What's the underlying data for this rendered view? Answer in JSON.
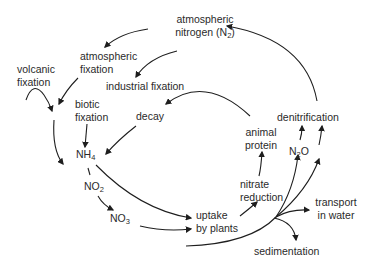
{
  "diagram": {
    "type": "nitrogen-cycle",
    "nodes": {
      "atmospheric_nitrogen": {
        "line1": "atmospheric",
        "line2": "nitrogen (N",
        "sub": "2",
        "tail": ")"
      },
      "atmospheric_fixation": {
        "line1": "atmospheric",
        "line2": "fixation"
      },
      "volcanic_fixation": {
        "line1": "volcanic",
        "line2": "fixation"
      },
      "industrial_fixation": {
        "label": "industrial fixation"
      },
      "biotic_fixation": {
        "line1": "biotic",
        "line2": "fixation"
      },
      "decay": {
        "label": "decay"
      },
      "nh4": {
        "base": "NH",
        "sub": "4"
      },
      "no2": {
        "base": "NO",
        "sub": "2"
      },
      "no3": {
        "base": "NO",
        "sub": "3"
      },
      "uptake_by_plants": {
        "line1": "uptake",
        "line2": "by plants"
      },
      "nitrate_reduction": {
        "line1": "nitrate",
        "line2": "reduction"
      },
      "animal_protein": {
        "line1": "animal",
        "line2": "protein"
      },
      "denitrification": {
        "label": "denitrification"
      },
      "n2o": {
        "base": "N",
        "sub": "2",
        "tail": "O"
      },
      "transport_in_water": {
        "line1": "transport",
        "line2": "in water"
      },
      "sedimentation": {
        "label": "sedimentation"
      }
    },
    "edges": [
      {
        "from": "atmospheric nitrogen (N2)",
        "to": "atmospheric fixation"
      },
      {
        "from": "atmospheric nitrogen (N2)",
        "to": "industrial fixation"
      },
      {
        "from": "atmospheric fixation",
        "to": "NH4 pathway"
      },
      {
        "from": "volcanic fixation",
        "to": "NH4 pathway"
      },
      {
        "from": "biotic fixation",
        "to": "NH4"
      },
      {
        "from": "animal protein",
        "to": "decay"
      },
      {
        "from": "decay",
        "to": "NH4"
      },
      {
        "from": "NH4",
        "to": "NO2"
      },
      {
        "from": "NO2",
        "to": "NO3"
      },
      {
        "from": "NH4",
        "to": "uptake by plants"
      },
      {
        "from": "NO3",
        "to": "uptake by plants"
      },
      {
        "from": "uptake by plants",
        "to": "nitrate reduction"
      },
      {
        "from": "nitrate reduction",
        "to": "animal protein"
      },
      {
        "from": "NO3",
        "to": "N2O"
      },
      {
        "from": "NO3",
        "to": "denitrification"
      },
      {
        "from": "NO3",
        "to": "transport in water"
      },
      {
        "from": "NO3",
        "to": "sedimentation"
      },
      {
        "from": "N2O",
        "to": "denitrification"
      },
      {
        "from": "denitrification",
        "to": "atmospheric nitrogen (N2)"
      }
    ]
  }
}
